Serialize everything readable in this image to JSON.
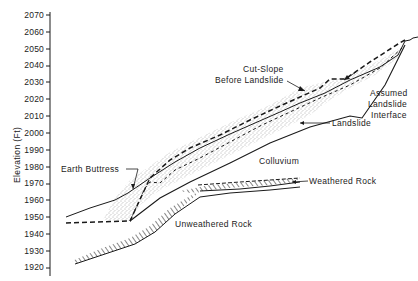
{
  "figure": {
    "type": "geologic-cross-section",
    "y_axis": {
      "label": "Elevation (Ft)",
      "ticks": [
        "2070",
        "2060",
        "2050",
        "2040",
        "2030",
        "2020",
        "2010",
        "2000",
        "1990",
        "1980",
        "1970",
        "1960",
        "1950",
        "1940",
        "1930",
        "1920"
      ],
      "range": [
        1920,
        2070
      ]
    },
    "annotations": {
      "cut_slope": [
        "Cut-Slope",
        "Before Landslide"
      ],
      "assumed_interface": [
        "Assumed",
        "Landslide",
        "Interface"
      ],
      "landslide": "Landslide",
      "earth_buttress": "Earth Buttress",
      "colluvium": "Colluvium",
      "weathered_rock": "Weathered Rock",
      "unweathered_rock": "Unweathered Rock"
    },
    "colors": {
      "ink": "#1a1a1a",
      "background": "#ffffff",
      "stipple": "#555555"
    }
  }
}
